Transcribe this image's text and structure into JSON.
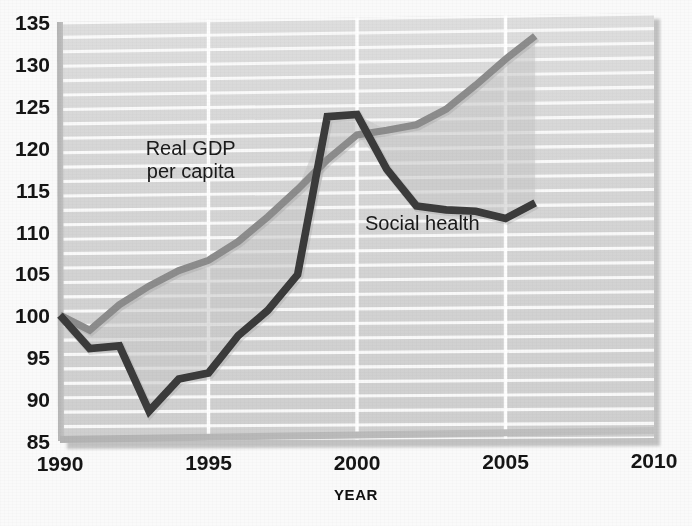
{
  "chart_data": {
    "type": "line",
    "title": "",
    "xlabel": "YEAR",
    "ylabel": "",
    "xlim": [
      1990,
      2010
    ],
    "ylim": [
      85,
      135
    ],
    "grid": true,
    "legend_position": "inline-annotation",
    "x_ticks": [
      "1990",
      "1995",
      "2000",
      "2005",
      "2010"
    ],
    "x_tick_values": [
      1990,
      1995,
      2000,
      2005,
      2010
    ],
    "y_ticks": [
      "85",
      "90",
      "95",
      "100",
      "105",
      "110",
      "115",
      "120",
      "125",
      "130",
      "135"
    ],
    "y_tick_values": [
      85,
      90,
      95,
      100,
      105,
      110,
      115,
      120,
      125,
      130,
      135
    ],
    "x": [
      1990,
      1991,
      1992,
      1993,
      1994,
      1995,
      1996,
      1997,
      1998,
      1999,
      2000,
      2001,
      2002,
      2003,
      2004,
      2005,
      2006
    ],
    "series": [
      {
        "name": "Real GDP per capita",
        "color": "#8c8c8c",
        "values": [
          100,
          98.2,
          101.2,
          103.4,
          105.2,
          106.4,
          108.6,
          111.5,
          114.7,
          118.2,
          121.1,
          121.6,
          122.2,
          124.0,
          126.8,
          129.8,
          132.5
        ]
      },
      {
        "name": "Social health",
        "color": "#3a3a3a",
        "values": [
          100,
          96.0,
          96.3,
          88.5,
          92.3,
          93.0,
          97.4,
          100.4,
          104.6,
          123.3,
          123.5,
          117.0,
          112.6,
          112.1,
          111.9,
          111.0,
          112.8
        ]
      }
    ],
    "annotations": [
      {
        "text": "Real GDP",
        "x": 1994.4,
        "y": 119.0,
        "name": "annotation-real-gdp-line1"
      },
      {
        "text": "per capita",
        "x": 1994.4,
        "y": 116.2,
        "name": "annotation-real-gdp-line2"
      },
      {
        "text": "Social health",
        "x": 2002.2,
        "y": 109.8,
        "name": "annotation-social-health"
      }
    ],
    "colors": {
      "gdp_line": "#8c8c8c",
      "social_health_line": "#3a3a3a",
      "plot_background": "#d5d5d5",
      "gridline": "#fbfbfb",
      "axis": "#9a9a9a",
      "page_background": "#fafafa",
      "text": "#151515"
    }
  }
}
